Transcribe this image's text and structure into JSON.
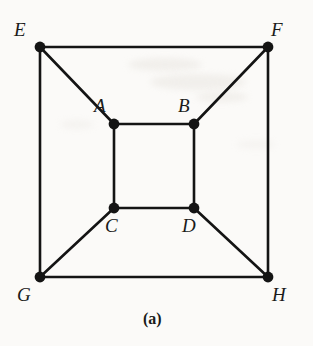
{
  "figure": {
    "caption": "(a)",
    "caption_pos": {
      "x": 143,
      "y": 311
    },
    "background_color": "#fbfaf8",
    "ink_color": "#141414",
    "edge_width": 2.6,
    "vertex_radius": 5.4,
    "canvas": {
      "width": 313,
      "height": 346
    }
  },
  "graph": {
    "type": "undirected-graph",
    "name": "nested-squares-graph",
    "vertex_count": 8,
    "edge_count": 12,
    "vertices": [
      {
        "id": "A",
        "label": "A",
        "x": 114,
        "y": 124,
        "label_x": 94,
        "label_y": 96,
        "label_anchor": "above-left"
      },
      {
        "id": "B",
        "label": "B",
        "x": 194,
        "y": 124,
        "label_x": 178,
        "label_y": 96,
        "label_anchor": "above-left"
      },
      {
        "id": "C",
        "label": "C",
        "x": 114,
        "y": 208,
        "label_x": 105,
        "label_y": 216,
        "label_anchor": "below-left"
      },
      {
        "id": "D",
        "label": "D",
        "x": 194,
        "y": 208,
        "label_x": 182,
        "label_y": 216,
        "label_anchor": "below-left"
      },
      {
        "id": "E",
        "label": "E",
        "x": 40,
        "y": 47,
        "label_x": 14,
        "label_y": 20,
        "label_anchor": "above-left"
      },
      {
        "id": "F",
        "label": "F",
        "x": 268,
        "y": 47,
        "label_x": 271,
        "label_y": 20,
        "label_anchor": "above-right"
      },
      {
        "id": "G",
        "label": "G",
        "x": 40,
        "y": 277,
        "label_x": 17,
        "label_y": 285,
        "label_anchor": "below-left"
      },
      {
        "id": "H",
        "label": "H",
        "x": 268,
        "y": 277,
        "label_x": 272,
        "label_y": 285,
        "label_anchor": "below-right"
      }
    ],
    "edges": [
      {
        "from": "E",
        "to": "F",
        "group": "outer-square"
      },
      {
        "from": "F",
        "to": "H",
        "group": "outer-square"
      },
      {
        "from": "H",
        "to": "G",
        "group": "outer-square"
      },
      {
        "from": "G",
        "to": "E",
        "group": "outer-square"
      },
      {
        "from": "A",
        "to": "B",
        "group": "inner-square"
      },
      {
        "from": "B",
        "to": "D",
        "group": "inner-square"
      },
      {
        "from": "D",
        "to": "C",
        "group": "inner-square"
      },
      {
        "from": "C",
        "to": "A",
        "group": "inner-square"
      },
      {
        "from": "E",
        "to": "A",
        "group": "diagonal-spoke"
      },
      {
        "from": "F",
        "to": "B",
        "group": "diagonal-spoke"
      },
      {
        "from": "G",
        "to": "C",
        "group": "diagonal-spoke"
      },
      {
        "from": "H",
        "to": "D",
        "group": "diagonal-spoke"
      }
    ]
  }
}
